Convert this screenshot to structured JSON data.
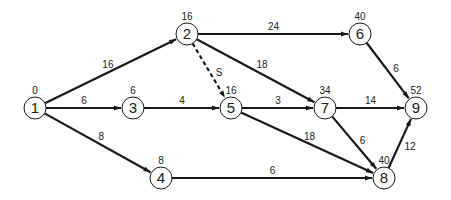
{
  "diagram": {
    "type": "activity-network",
    "nodes": [
      {
        "id": "1",
        "label": "1",
        "time": "0",
        "x": 35,
        "y": 108
      },
      {
        "id": "2",
        "label": "2",
        "time": "16",
        "x": 187,
        "y": 34
      },
      {
        "id": "3",
        "label": "3",
        "time": "6",
        "x": 133,
        "y": 108
      },
      {
        "id": "4",
        "label": "4",
        "time": "8",
        "x": 161,
        "y": 178
      },
      {
        "id": "5",
        "label": "5",
        "time": "16",
        "x": 231,
        "y": 108
      },
      {
        "id": "6",
        "label": "6",
        "time": "40",
        "x": 360,
        "y": 34
      },
      {
        "id": "7",
        "label": "7",
        "time": "34",
        "x": 325,
        "y": 108
      },
      {
        "id": "8",
        "label": "8",
        "time": "40",
        "x": 384,
        "y": 178
      },
      {
        "id": "9",
        "label": "9",
        "time": "52",
        "x": 416,
        "y": 108
      }
    ],
    "edges": [
      {
        "from": "1",
        "to": "2",
        "label": "16",
        "dashed": false
      },
      {
        "from": "1",
        "to": "3",
        "label": "6",
        "dashed": false
      },
      {
        "from": "1",
        "to": "4",
        "label": "8",
        "dashed": false
      },
      {
        "from": "2",
        "to": "6",
        "label": "24",
        "dashed": false
      },
      {
        "from": "2",
        "to": "5",
        "label": "S",
        "dashed": true
      },
      {
        "from": "2",
        "to": "7",
        "label": "18",
        "dashed": false
      },
      {
        "from": "3",
        "to": "5",
        "label": "4",
        "dashed": false
      },
      {
        "from": "5",
        "to": "7",
        "label": "3",
        "dashed": false
      },
      {
        "from": "5",
        "to": "8",
        "label": "18",
        "dashed": false
      },
      {
        "from": "4",
        "to": "8",
        "label": "6",
        "dashed": false
      },
      {
        "from": "6",
        "to": "9",
        "label": "6",
        "dashed": false
      },
      {
        "from": "7",
        "to": "9",
        "label": "14",
        "dashed": false
      },
      {
        "from": "7",
        "to": "8",
        "label": "6",
        "dashed": false
      },
      {
        "from": "8",
        "to": "9",
        "label": "12",
        "dashed": false
      }
    ],
    "colors": {
      "stroke": "#1a1a1a",
      "node_fill": "#ffffff",
      "text": "#222222"
    }
  }
}
